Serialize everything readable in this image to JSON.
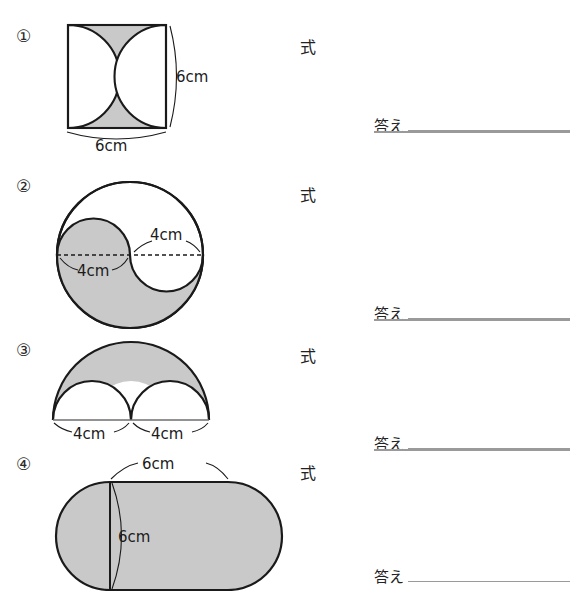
{
  "worksheet": {
    "title": "図形の面積 練習問題",
    "background_color": "#ffffff",
    "shade_color": "#c9c9c9",
    "stroke_color": "#1a1a1a",
    "rule_color": "#9a9a9a"
  },
  "labels": {
    "shiki": "式",
    "kotae": "答え"
  },
  "problems": [
    {
      "number": "①",
      "shiki_label": "式",
      "answer_label": "答え",
      "figure": {
        "name": "square-with-two-inward-semicircles",
        "shape": "square",
        "dimensions": [
          {
            "value": "6cm",
            "position": "right",
            "measures": "height"
          },
          {
            "value": "6cm",
            "position": "bottom",
            "measures": "width"
          }
        ]
      }
    },
    {
      "number": "②",
      "shiki_label": "式",
      "answer_label": "答え",
      "figure": {
        "name": "yin-yang-circle",
        "shape": "circle",
        "dimensions": [
          {
            "value": "4cm",
            "position": "left",
            "measures": "small-circle-diameter"
          },
          {
            "value": "4cm",
            "position": "right",
            "measures": "small-circle-diameter"
          }
        ]
      }
    },
    {
      "number": "③",
      "shiki_label": "式",
      "answer_label": "答え",
      "figure": {
        "name": "semicircle-minus-two-semicircles",
        "shape": "semicircle",
        "dimensions": [
          {
            "value": "4cm",
            "position": "bottom-left",
            "measures": "small-semicircle-diameter"
          },
          {
            "value": "4cm",
            "position": "bottom-right",
            "measures": "small-semicircle-diameter"
          }
        ]
      }
    },
    {
      "number": "④",
      "shiki_label": "式",
      "answer_label": "答え",
      "figure": {
        "name": "stadium-shape",
        "shape": "stadium",
        "dimensions": [
          {
            "value": "6cm",
            "position": "top",
            "measures": "rectangle-width"
          },
          {
            "value": "6cm",
            "position": "inner-vertical",
            "measures": "height"
          }
        ]
      }
    }
  ]
}
